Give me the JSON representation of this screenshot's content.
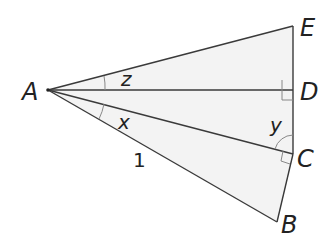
{
  "diagram": {
    "type": "geometry",
    "colors": {
      "stroke": "#3a3a3a",
      "fill": "#f3f3f3",
      "text": "#222222",
      "marker": "#888888"
    },
    "points": {
      "A": {
        "label": "A",
        "x": 48,
        "y": 90
      },
      "B": {
        "label": "B",
        "x": 277,
        "y": 222
      },
      "C": {
        "label": "C",
        "x": 293,
        "y": 154
      },
      "D": {
        "label": "D",
        "x": 293,
        "y": 90
      },
      "E": {
        "label": "E",
        "x": 293,
        "y": 26
      }
    },
    "segments": [
      [
        "A",
        "E"
      ],
      [
        "A",
        "D"
      ],
      [
        "A",
        "C"
      ],
      [
        "A",
        "B"
      ],
      [
        "E",
        "D"
      ],
      [
        "D",
        "C"
      ],
      [
        "C",
        "B"
      ]
    ],
    "angle_labels": {
      "z": "z",
      "x": "x",
      "y": "y"
    },
    "side_labels": {
      "AB": "1"
    },
    "right_angles": [
      "ADE",
      "ACB"
    ]
  }
}
